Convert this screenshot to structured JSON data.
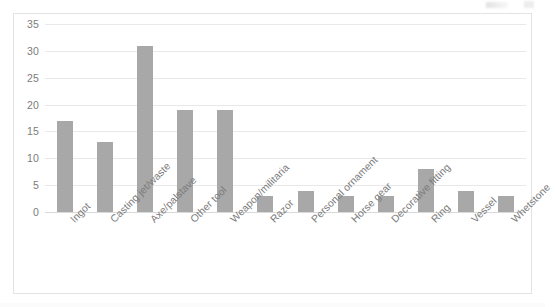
{
  "chart_data": {
    "type": "bar",
    "title": "",
    "subtitle": "",
    "xlabel": "",
    "ylabel": "",
    "ylim": [
      0,
      35
    ],
    "yticks": [
      0,
      5,
      10,
      15,
      20,
      25,
      30,
      35
    ],
    "ytick_labels": [
      "0",
      "5",
      "10",
      "15",
      "20",
      "25",
      "30",
      "35"
    ],
    "grid": true,
    "legend": false,
    "legend_position": "none",
    "bar_color": "#a8a8a8",
    "gridline_color": "#e8e8e8",
    "frame_color": "#e3e3e3",
    "tick_label_color": "#7b7b7b",
    "categories": [
      "Ingot",
      "Casting jet/waste",
      "Axe/palstave",
      "Other tool",
      "Weapon/militaria",
      "Razor",
      "Personal ornament",
      "Horse gear",
      "Decorative fitting",
      "Ring",
      "Vessel",
      "Whetstone"
    ],
    "values": [
      17,
      13,
      31,
      19,
      19,
      3,
      4,
      3,
      3,
      8,
      4,
      3
    ]
  }
}
